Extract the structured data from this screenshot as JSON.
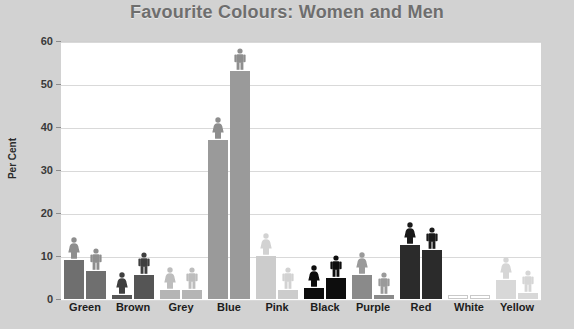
{
  "chart_data": {
    "type": "bar",
    "title": "Favourite Colours: Women and Men",
    "xlabel": "",
    "ylabel": "Per Cent",
    "ylim": [
      0,
      60
    ],
    "yticks": [
      0,
      10,
      20,
      30,
      40,
      50,
      60
    ],
    "grid": true,
    "legend_position": "none",
    "legend": [
      "Women",
      "Men"
    ],
    "annotations": "Each bar is topped by a pictogram icon: a woman figure for the Women series and a man figure for the Men series.",
    "categories": [
      "Green",
      "Brown",
      "Grey",
      "Blue",
      "Pink",
      "Black",
      "Purple",
      "Red",
      "White",
      "Yellow"
    ],
    "series": [
      {
        "name": "Women",
        "values": [
          9,
          1,
          2,
          37,
          10,
          2.5,
          5.5,
          12.5,
          1,
          4.5
        ]
      },
      {
        "name": "Men",
        "values": [
          6.5,
          5.5,
          2,
          53,
          2,
          5,
          1,
          11.5,
          1,
          1.5
        ]
      }
    ],
    "bar_colors": {
      "Green": "#6f6f6f",
      "Brown": "#555555",
      "Grey": "#b5b5b5",
      "Blue": "#9a9a9a",
      "Pink": "#cccccc",
      "Black": "#0d0d0d",
      "Purple": "#8a8a8a",
      "Red": "#2b2b2b",
      "White": "#ffffff",
      "Yellow": "#d8d8d8"
    },
    "icon_colors": {
      "Green": "#8e8e8e",
      "Brown": "#3f3f3f",
      "Grey": "#bdbdbd",
      "Blue": "#8e8e8e",
      "Pink": "#d2d2d2",
      "Black": "#0d0d0d",
      "Purple": "#9a9a9a",
      "Red": "#1a1a1a",
      "White": "#ffffff",
      "Yellow": "#d6d6d6"
    }
  },
  "theme": {
    "page_background": "#d2d2d2",
    "plot_background": "#ffffff",
    "title_color": "#6e6e6e",
    "grid_color": "#d9d9d9",
    "axis_text_color": "#1d1d1d"
  },
  "icons": {
    "woman": "woman-figure-icon",
    "man": "man-figure-icon"
  }
}
